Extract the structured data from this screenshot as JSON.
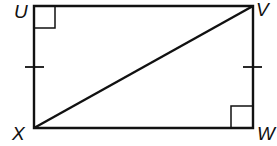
{
  "diagram": {
    "type": "rectangle-with-diagonal",
    "vertices": [
      {
        "label": "U",
        "x": 34,
        "y": 6
      },
      {
        "label": "V",
        "x": 253,
        "y": 6
      },
      {
        "label": "W",
        "x": 253,
        "y": 128
      },
      {
        "label": "X",
        "x": 34,
        "y": 128
      }
    ],
    "diagonal": [
      "X",
      "V"
    ],
    "right_angle_marks": [
      "U",
      "W"
    ],
    "congruence_ticks": [
      "UX",
      "VW"
    ],
    "stroke_color": "#111111"
  }
}
